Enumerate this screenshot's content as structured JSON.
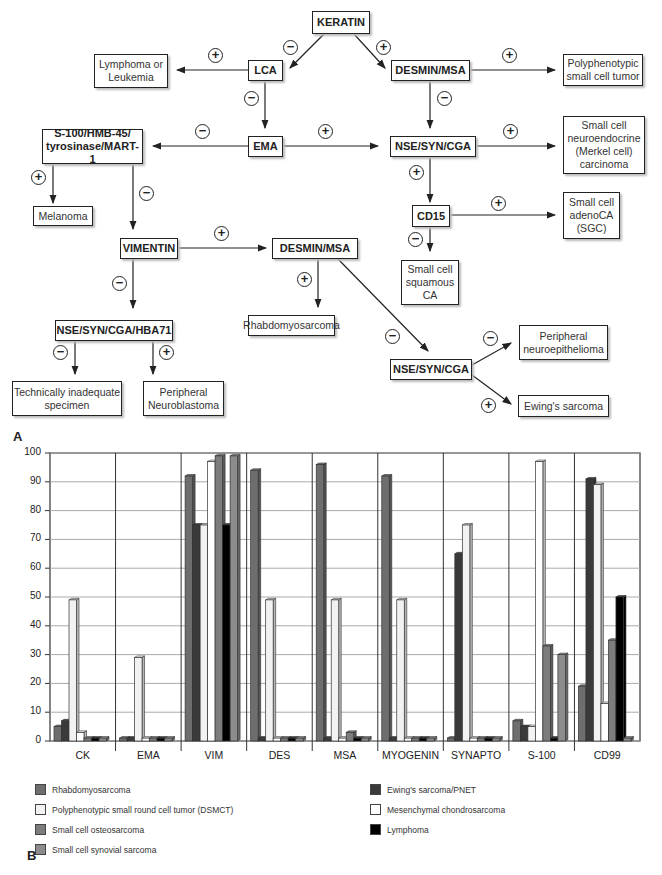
{
  "panel_labels": {
    "a": "A",
    "b": "B"
  },
  "flowchart": {
    "signs": {
      "plus": "+",
      "minus": "−"
    },
    "nodes": {
      "keratin": "KERATIN",
      "lca": "LCA",
      "desmin_msa_top": "DESMIN/MSA",
      "lymphoma_leukemia": "Lymphoma or Leukemia",
      "polyphenotypic": "Polyphenotypic small cell tumor",
      "ema": "EMA",
      "s100_group": "S-100/HMB-45/ tyrosinase/MART-1",
      "nse_syn_cga_top": "NSE/SYN/CGA",
      "merkel": "Small cell neuroendocrine (Merkel cell) carcinoma",
      "melanoma": "Melanoma",
      "cd15": "CD15",
      "adenoca": "Small cell adenoCA (SGC)",
      "vimentin": "VIMENTIN",
      "desmin_msa_mid": "DESMIN/MSA",
      "squamous": "Small cell squamous CA",
      "nse_hba71": "NSE/SYN/CGA/HBA71",
      "rhabdo": "Rhabdomyosarcoma",
      "nse_syn_cga_bottom": "NSE/SYN/CGA",
      "neuroepithelioma": "Peripheral neuroepithelioma",
      "inadequate": "Technically inadequate specimen",
      "neuroblastoma": "Peripheral Neuroblastoma",
      "ewing": "Ewing's sarcoma"
    }
  },
  "chart_data": {
    "type": "bar",
    "title": "",
    "xlabel": "",
    "ylabel": "",
    "ylim": [
      0,
      100
    ],
    "yticks": [
      0,
      10,
      20,
      30,
      40,
      50,
      60,
      70,
      80,
      90,
      100
    ],
    "grid": true,
    "legend_position": "bottom",
    "categories": [
      "CK",
      "EMA",
      "VIM",
      "DES",
      "MSA",
      "MYOGENIN",
      "SYNAPTO",
      "S-100",
      "CD99"
    ],
    "series": [
      {
        "name": "Rhabdomyosarcoma",
        "color": "#6e6e6e",
        "values": [
          5,
          1,
          92,
          94,
          96,
          92,
          1,
          7,
          19
        ]
      },
      {
        "name": "Ewing's sarcoma/PNET",
        "color": "#3a3a3a",
        "values": [
          7,
          1,
          75,
          1,
          1,
          1,
          65,
          5,
          91
        ]
      },
      {
        "name": "Polyphenotypic small round cell tumor (DSMCT)",
        "color": "#f2f2f2",
        "values": [
          49,
          29,
          75,
          49,
          49,
          49,
          75,
          5,
          89
        ]
      },
      {
        "name": "Mesenchymal chondrosarcoma",
        "color": "#ffffff",
        "values": [
          3,
          1,
          97,
          1,
          1,
          1,
          1,
          97,
          13
        ]
      },
      {
        "name": "Small cell osteosarcoma",
        "color": "#7c7c7c",
        "values": [
          1,
          1,
          99,
          1,
          3,
          1,
          1,
          33,
          35
        ]
      },
      {
        "name": "Lymphoma",
        "color": "#000000",
        "values": [
          1,
          1,
          75,
          1,
          1,
          1,
          1,
          1,
          50
        ]
      },
      {
        "name": "Small cell synovial sarcoma",
        "color": "#8c8c8c",
        "values": [
          1,
          1,
          99,
          1,
          1,
          1,
          1,
          30,
          1
        ]
      }
    ],
    "legend": [
      {
        "name": "Rhabdomyosarcoma",
        "color": "#6e6e6e"
      },
      {
        "name": "Polyphenotypic small round cell tumor (DSMCT)",
        "color": "#f2f2f2"
      },
      {
        "name": "Small cell osteosarcoma",
        "color": "#7c7c7c"
      },
      {
        "name": "Small cell synovial sarcoma",
        "color": "#8c8c8c"
      },
      {
        "name": "Ewing's sarcoma/PNET",
        "color": "#3a3a3a"
      },
      {
        "name": "Mesenchymal chondrosarcoma",
        "color": "#ffffff"
      },
      {
        "name": "Lymphoma",
        "color": "#000000"
      }
    ]
  }
}
